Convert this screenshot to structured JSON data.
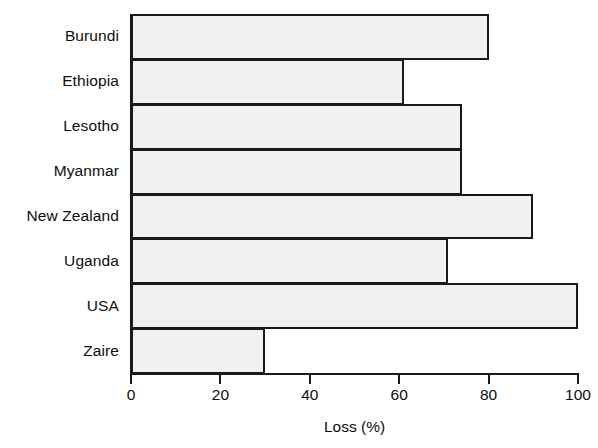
{
  "chart_data": {
    "type": "bar",
    "orientation": "horizontal",
    "title": "",
    "subtitle": "",
    "categories": [
      "Burundi",
      "Ethiopia",
      "Lesotho",
      "Myanmar",
      "New Zealand",
      "Uganda",
      "USA",
      "Zaire"
    ],
    "values": [
      80,
      61,
      74,
      74,
      90,
      71,
      100,
      30
    ],
    "xlabel": "Loss (%)",
    "ylabel": "",
    "xlim": [
      0,
      100
    ],
    "xticks": [
      0,
      20,
      40,
      60,
      80,
      100
    ],
    "xtick_labels": [
      "0",
      "20",
      "40",
      "60",
      "80",
      "100"
    ],
    "grid": false,
    "legend": false,
    "legend_position": "none",
    "bar_fill_color": "#f1f1f1",
    "bar_edge_color": "#1a1a1a",
    "background_color": "#ffffff",
    "text_color": "#0d0d0d"
  }
}
